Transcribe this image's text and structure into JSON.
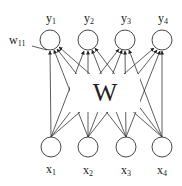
{
  "diagram": {
    "type": "single-layer-neural-network",
    "weight_matrix_label": "W",
    "weight_annotation": {
      "base": "w",
      "sub": "11"
    },
    "outputs": [
      {
        "base": "y",
        "sub": "1"
      },
      {
        "base": "y",
        "sub": "2"
      },
      {
        "base": "y",
        "sub": "3"
      },
      {
        "base": "y",
        "sub": "4"
      }
    ],
    "inputs": [
      {
        "base": "x",
        "sub": "1"
      },
      {
        "base": "x",
        "sub": "2"
      },
      {
        "base": "x",
        "sub": "3"
      },
      {
        "base": "x",
        "sub": "4"
      }
    ],
    "colors": {
      "stroke": "#222222",
      "background": "#ffffff"
    }
  }
}
